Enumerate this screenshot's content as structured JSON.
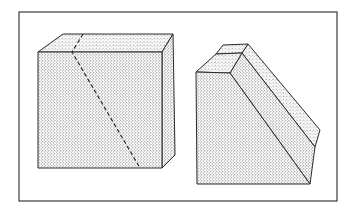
{
  "figure": {
    "colors": {
      "background": "#ffffff",
      "stroke": "#2a2a2a",
      "stipple_dot": "#555555",
      "frame": "#3a3a3a"
    },
    "frame": {
      "x": 19,
      "y": 12,
      "width": 318,
      "height": 189
    },
    "cube": {
      "label": "cube",
      "front_face": [
        [
          38,
          52
        ],
        [
          162,
          52
        ],
        [
          162,
          168
        ],
        [
          38,
          168
        ]
      ],
      "top_face": [
        [
          38,
          52
        ],
        [
          63,
          34
        ],
        [
          173,
          34
        ],
        [
          162,
          52
        ]
      ],
      "right_face": [
        [
          162,
          52
        ],
        [
          173,
          34
        ],
        [
          175,
          155
        ],
        [
          162,
          168
        ]
      ],
      "dashed_cut_line": [
        [
          83,
          34
        ],
        [
          72,
          52
        ],
        [
          140,
          168
        ]
      ]
    },
    "prism": {
      "label": "cut-prism",
      "front_face": [
        [
          196,
          72
        ],
        [
          230,
          73
        ],
        [
          310,
          184
        ],
        [
          197,
          184
        ]
      ],
      "top_back_face": [
        [
          216,
          54
        ],
        [
          223,
          45
        ],
        [
          248,
          44
        ],
        [
          242,
          53
        ]
      ],
      "top_front_face": [
        [
          196,
          72
        ],
        [
          216,
          54
        ],
        [
          242,
          53
        ],
        [
          230,
          73
        ]
      ],
      "slope_face_inner": [
        [
          230,
          73
        ],
        [
          242,
          53
        ],
        [
          315,
          147
        ],
        [
          310,
          184
        ]
      ],
      "slope_face_outer": [
        [
          242,
          53
        ],
        [
          248,
          44
        ],
        [
          320,
          130
        ],
        [
          315,
          147
        ]
      ],
      "right_face": [
        [
          310,
          184
        ],
        [
          315,
          147
        ],
        [
          320,
          130
        ],
        [
          318,
          150
        ]
      ]
    }
  }
}
